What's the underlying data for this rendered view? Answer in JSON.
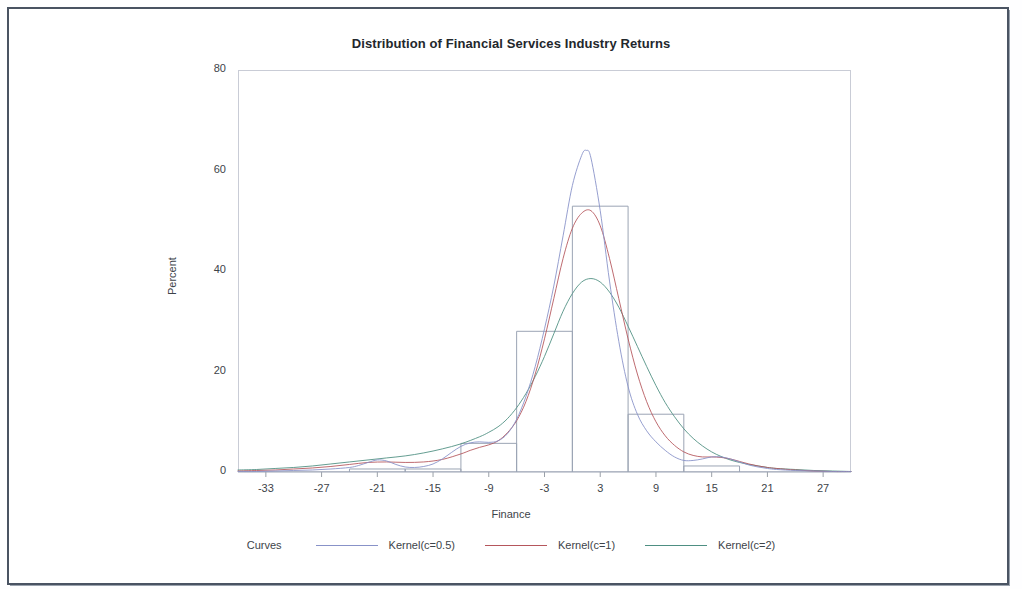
{
  "chart_data": {
    "type": "histogram",
    "title": "Distribution of Financial Services Industry Returns",
    "xlabel": "Finance",
    "ylabel": "Percent",
    "xlim": [
      -36,
      30
    ],
    "ylim": [
      0,
      80
    ],
    "xticks": [
      "-33",
      "-27",
      "-21",
      "-15",
      "-9",
      "-3",
      "3",
      "9",
      "15",
      "21",
      "27"
    ],
    "xtick_values": [
      -33,
      -27,
      -21,
      -15,
      -9,
      -3,
      3,
      9,
      15,
      21,
      27
    ],
    "yticks": [
      "0",
      "20",
      "40",
      "60",
      "80"
    ],
    "ytick_values": [
      0,
      20,
      40,
      60,
      80
    ],
    "grid": false,
    "bin_width": 6,
    "bars": [
      {
        "left": -36,
        "right": -30,
        "height": 0.0
      },
      {
        "left": -30,
        "right": -24,
        "height": 0.0
      },
      {
        "left": -24,
        "right": -18,
        "height": 0.6
      },
      {
        "left": -18,
        "right": -12,
        "height": 0.6
      },
      {
        "left": -12,
        "right": -6,
        "height": 5.7
      },
      {
        "left": -6,
        "right": 0,
        "height": 28.0
      },
      {
        "left": 0,
        "right": 6,
        "height": 52.9
      },
      {
        "left": 6,
        "right": 12,
        "height": 11.5
      },
      {
        "left": 12,
        "right": 18,
        "height": 1.2
      },
      {
        "left": 18,
        "right": 24,
        "height": 0.0
      },
      {
        "left": 24,
        "right": 30,
        "height": 0.0
      }
    ],
    "legend": {
      "position": "bottom",
      "title": "Curves",
      "entries": [
        {
          "label": "Kernel(c=0.5)",
          "color": "#8892c8"
        },
        {
          "label": "Kernel(c=1)",
          "color": "#b5565c"
        },
        {
          "label": "Kernel(c=2)",
          "color": "#4e8f82"
        }
      ]
    },
    "series": [
      {
        "name": "Kernel(c=0.5)",
        "color": "#8892c8",
        "peak_x": 1.5,
        "peak_y": 64.0,
        "x": [
          -36,
          -34,
          -32,
          -30,
          -28,
          -26,
          -24,
          -23,
          -22,
          -21,
          -20,
          -19,
          -18,
          -17,
          -16,
          -15,
          -14,
          -13,
          -12,
          -11,
          -10,
          -9,
          -8,
          -7,
          -6,
          -5,
          -4,
          -3,
          -2,
          -1,
          0,
          1,
          1.5,
          2,
          3,
          4,
          5,
          6,
          7,
          8,
          9,
          10,
          11,
          12,
          13,
          14,
          15,
          16,
          17,
          18,
          19,
          20,
          21,
          22,
          24,
          26,
          28,
          30
        ],
        "y": [
          0.1,
          0.1,
          0.2,
          0.3,
          0.4,
          0.6,
          0.9,
          1.3,
          1.9,
          2.4,
          2.2,
          1.5,
          1.0,
          0.9,
          1.1,
          1.6,
          2.6,
          3.9,
          5.1,
          5.8,
          6.0,
          5.9,
          6.2,
          7.6,
          10.5,
          15.0,
          21.0,
          28.5,
          37.0,
          47.0,
          57.0,
          63.0,
          64.0,
          62.5,
          52.0,
          38.0,
          26.0,
          17.0,
          11.5,
          8.2,
          6.0,
          4.3,
          3.0,
          2.3,
          2.3,
          2.6,
          3.0,
          3.0,
          2.6,
          2.0,
          1.4,
          1.0,
          0.7,
          0.5,
          0.3,
          0.2,
          0.1,
          0.1
        ]
      },
      {
        "name": "Kernel(c=1)",
        "color": "#b5565c",
        "peak_x": 2.0,
        "peak_y": 52.0,
        "x": [
          -36,
          -34,
          -32,
          -30,
          -28,
          -26,
          -24,
          -22,
          -20,
          -18,
          -16,
          -14,
          -12,
          -11,
          -10,
          -9,
          -8,
          -7,
          -6,
          -5,
          -4,
          -3,
          -2,
          -1,
          0,
          1,
          2,
          3,
          4,
          5,
          6,
          7,
          8,
          9,
          10,
          11,
          12,
          13,
          14,
          15,
          16,
          17,
          18,
          19,
          20,
          21,
          22,
          24,
          26,
          28,
          30
        ],
        "y": [
          0.2,
          0.3,
          0.4,
          0.6,
          0.8,
          1.1,
          1.5,
          1.9,
          2.0,
          1.9,
          2.0,
          2.5,
          3.6,
          4.3,
          4.9,
          5.4,
          6.2,
          7.8,
          10.2,
          14.0,
          19.5,
          26.5,
          34.5,
          42.5,
          48.5,
          51.5,
          52.0,
          49.0,
          42.5,
          34.5,
          26.5,
          19.5,
          14.0,
          10.0,
          7.2,
          5.3,
          4.0,
          3.3,
          3.0,
          3.0,
          2.9,
          2.6,
          2.1,
          1.6,
          1.2,
          0.9,
          0.7,
          0.4,
          0.2,
          0.1,
          0.1
        ]
      },
      {
        "name": "Kernel(c=2)",
        "color": "#4e8f82",
        "peak_x": 2.0,
        "peak_y": 38.5,
        "x": [
          -36,
          -34,
          -32,
          -30,
          -28,
          -26,
          -24,
          -22,
          -20,
          -18,
          -16,
          -14,
          -12,
          -10,
          -9,
          -8,
          -7,
          -6,
          -5,
          -4,
          -3,
          -2,
          -1,
          0,
          1,
          2,
          3,
          4,
          5,
          6,
          7,
          8,
          9,
          10,
          11,
          12,
          13,
          14,
          15,
          16,
          17,
          18,
          19,
          20,
          21,
          22,
          24,
          26,
          28,
          30
        ],
        "y": [
          0.4,
          0.5,
          0.7,
          0.9,
          1.2,
          1.6,
          2.0,
          2.4,
          2.8,
          3.2,
          3.8,
          4.6,
          5.6,
          7.0,
          7.9,
          9.0,
          10.6,
          12.8,
          15.6,
          19.0,
          23.0,
          27.5,
          32.0,
          35.5,
          37.8,
          38.5,
          37.8,
          35.8,
          32.8,
          29.0,
          25.0,
          21.0,
          17.2,
          13.8,
          11.0,
          8.6,
          6.7,
          5.2,
          4.0,
          3.1,
          2.4,
          1.9,
          1.5,
          1.2,
          0.9,
          0.7,
          0.5,
          0.3,
          0.2,
          0.1
        ]
      }
    ]
  },
  "axes": {
    "title": "Distribution of Financial Services Industry Returns",
    "xlabel": "Finance",
    "ylabel": "Percent"
  },
  "legend": {
    "title": "Curves",
    "entry_0": "Kernel(c=0.5)",
    "entry_1": "Kernel(c=1)",
    "entry_2": "Kernel(c=2)"
  }
}
